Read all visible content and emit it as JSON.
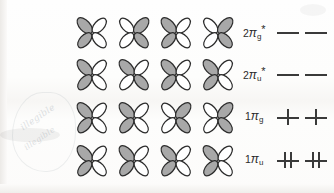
{
  "figure": {
    "kind": "molecular-orbital-diagram",
    "background_color": "#fdfdfd",
    "lobe_shaded_color": "#a8a8a8",
    "lobe_white_color": "#ffffff",
    "outline_color": "#2b2b2b",
    "mark_color": "#3a3a3a",
    "columns": 4
  },
  "rows": [
    {
      "id": "2pi-g-star",
      "label": {
        "number": "2",
        "symbol": "π",
        "subscript": "g",
        "superscript": "*",
        "text": "2πg*"
      },
      "orbitals": [
        {
          "name": "orbital-r1c1",
          "shaded_lobes": "upper-left,lower-left"
        },
        {
          "name": "orbital-r1c2",
          "shaded_lobes": "upper-right,lower-right"
        },
        {
          "name": "orbital-r1c3",
          "shaded_lobes": "upper-left,lower-left"
        },
        {
          "name": "orbital-r1c4",
          "shaded_lobes": "upper-right,lower-right"
        }
      ],
      "occupancy": [
        {
          "name": "level-r1-a",
          "electrons": 0
        },
        {
          "name": "level-r1-b",
          "electrons": 0
        }
      ]
    },
    {
      "id": "2pi-u-star",
      "label": {
        "number": "2",
        "symbol": "π",
        "subscript": "u",
        "superscript": "*",
        "text": "2πu*"
      },
      "orbitals": [
        {
          "name": "orbital-r2c1",
          "shaded_lobes": "upper-left,lower-left"
        },
        {
          "name": "orbital-r2c2",
          "shaded_lobes": "upper-left,lower-right"
        },
        {
          "name": "orbital-r2c3",
          "shaded_lobes": "upper-left,lower-left"
        },
        {
          "name": "orbital-r2c4",
          "shaded_lobes": "upper-left,lower-left"
        }
      ],
      "occupancy": [
        {
          "name": "level-r2-a",
          "electrons": 0
        },
        {
          "name": "level-r2-b",
          "electrons": 0
        }
      ]
    },
    {
      "id": "1pi-g",
      "label": {
        "number": "1",
        "symbol": "π",
        "subscript": "g",
        "superscript": "",
        "text": "1πg"
      },
      "orbitals": [
        {
          "name": "orbital-r3c1",
          "shaded_lobes": "upper-left,lower-left"
        },
        {
          "name": "orbital-r3c2",
          "shaded_lobes": "upper-left,lower-left"
        },
        {
          "name": "orbital-r3c3",
          "shaded_lobes": "upper-right,lower-right"
        },
        {
          "name": "orbital-r3c4",
          "shaded_lobes": "upper-right,lower-right"
        }
      ],
      "occupancy": [
        {
          "name": "level-r3-a",
          "electrons": 1
        },
        {
          "name": "level-r3-b",
          "electrons": 1
        }
      ]
    },
    {
      "id": "1pi-u",
      "label": {
        "number": "1",
        "symbol": "π",
        "subscript": "u",
        "superscript": "",
        "text": "1πu"
      },
      "orbitals": [
        {
          "name": "orbital-r4c1",
          "shaded_lobes": "upper-left,lower-left"
        },
        {
          "name": "orbital-r4c2",
          "shaded_lobes": "upper-left,lower-left"
        },
        {
          "name": "orbital-r4c3",
          "shaded_lobes": "upper-left,lower-left"
        },
        {
          "name": "orbital-r4c4",
          "shaded_lobes": "upper-left,lower-left"
        }
      ],
      "occupancy": [
        {
          "name": "level-r4-a",
          "electrons": 2
        },
        {
          "name": "level-r4-b",
          "electrons": 2
        }
      ]
    }
  ],
  "marginalia": {
    "note": "faint illegible handwritten show-through from reverse page",
    "line1": "illegible",
    "line2": "illegible"
  }
}
